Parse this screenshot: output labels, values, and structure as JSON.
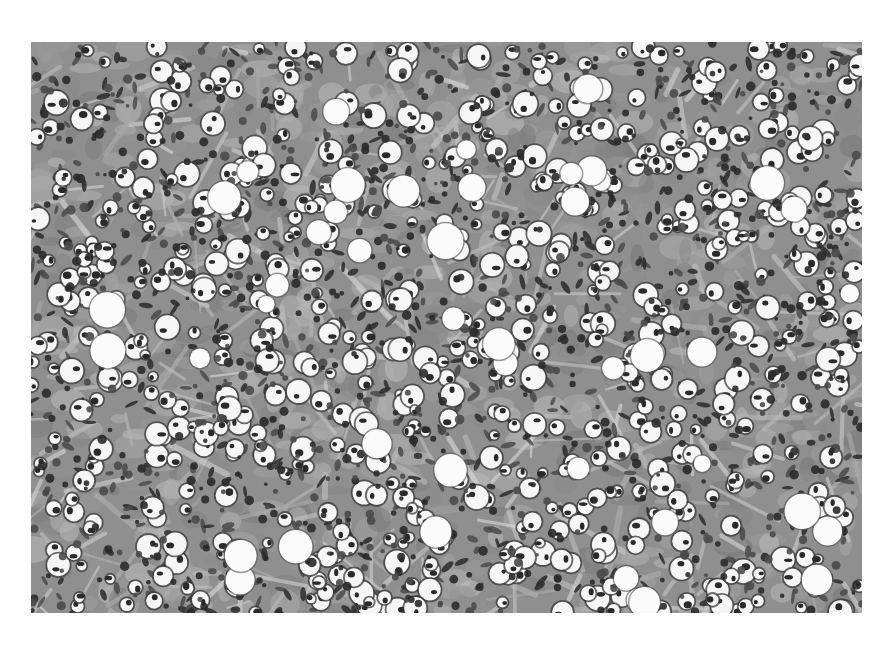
{
  "figure": {
    "type": "histology-micrograph",
    "stain_appearance": "grayscale",
    "caption_fragment": ""
  },
  "colors": {
    "page_background": "#ffffff",
    "tissue_background": "#8f8f8f",
    "stroma": "#b8b8b8",
    "nucleus_dark": "#2a2a2a",
    "nucleus_mid": "#4a4a4a",
    "clear_cytoplasm": "#f6f6f6"
  }
}
